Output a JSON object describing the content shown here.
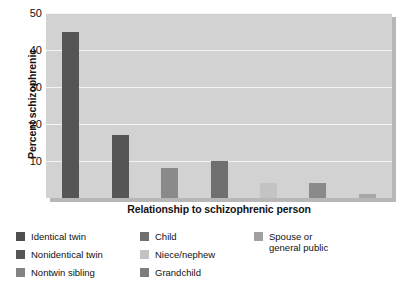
{
  "chart_data": {
    "type": "bar",
    "title": "",
    "xlabel": "Relationship to schizophrenic person",
    "ylabel": "Percent schizophrenic",
    "categories": [
      "Identical twin",
      "Nonidentical twin",
      "Nontwin sibling",
      "Child",
      "Niece/nephew",
      "Grandchild",
      "Spouse or general public"
    ],
    "values": [
      45,
      17,
      8,
      10,
      4,
      4,
      1
    ],
    "ylim": [
      0,
      50
    ],
    "yticks": [
      10,
      20,
      30,
      40,
      50
    ],
    "ytick_labels": [
      "10",
      "20",
      "30",
      "40",
      "50"
    ],
    "grid": true,
    "legend_position": "below",
    "bar_colors": [
      "#555555",
      "#555555",
      "#8a8a8a",
      "#6f6f6f",
      "#c3c3c3",
      "#8a8a8a",
      "#a8a8a8"
    ],
    "plot_background": "#d2d2d2",
    "gridline_color": "#f4f4f4"
  },
  "legend": {
    "columns": [
      {
        "items": [
          {
            "label": "Identical twin",
            "color": "#4f4f4f"
          },
          {
            "label": "Nonidentical twin",
            "color": "#555555"
          },
          {
            "label": "Nontwin sibling",
            "color": "#838383"
          }
        ]
      },
      {
        "items": [
          {
            "label": "Child",
            "color": "#6f6f6f"
          },
          {
            "label": "Niece/nephew",
            "color": "#c3c3c3"
          },
          {
            "label": "Grandchild",
            "color": "#7d7d7d"
          }
        ]
      },
      {
        "items": [
          {
            "label": "Spouse or\ngeneral public",
            "color": "#a0a0a0"
          }
        ]
      }
    ]
  }
}
